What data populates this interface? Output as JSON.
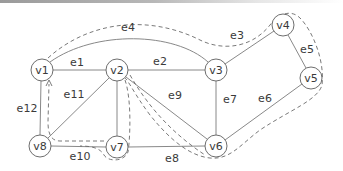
{
  "diagram": {
    "type": "undirected-graph",
    "nodes": [
      {
        "id": "v1",
        "label": "v1",
        "x": 42,
        "y": 70
      },
      {
        "id": "v2",
        "label": "v2",
        "x": 117,
        "y": 70
      },
      {
        "id": "v3",
        "label": "v3",
        "x": 216,
        "y": 70
      },
      {
        "id": "v4",
        "label": "v4",
        "x": 283,
        "y": 25
      },
      {
        "id": "v5",
        "label": "v5",
        "x": 311,
        "y": 78
      },
      {
        "id": "v6",
        "label": "v6",
        "x": 216,
        "y": 146
      },
      {
        "id": "v7",
        "label": "v7",
        "x": 117,
        "y": 147
      },
      {
        "id": "v8",
        "label": "v8",
        "x": 40,
        "y": 146
      }
    ],
    "edges": [
      {
        "id": "e1",
        "label": "e1",
        "from": "v1",
        "to": "v2"
      },
      {
        "id": "e2",
        "label": "e2",
        "from": "v2",
        "to": "v3"
      },
      {
        "id": "e3",
        "label": "e3",
        "from": "v3",
        "to": "v4"
      },
      {
        "id": "e4",
        "label": "e4",
        "from": "v1",
        "to": "v3",
        "curved": true
      },
      {
        "id": "e5",
        "label": "e5",
        "from": "v4",
        "to": "v5"
      },
      {
        "id": "e6",
        "label": "e6",
        "from": "v5",
        "to": "v6"
      },
      {
        "id": "e7",
        "label": "e7",
        "from": "v3",
        "to": "v6"
      },
      {
        "id": "e8",
        "label": "e8",
        "from": "v7",
        "to": "v6"
      },
      {
        "id": "e9",
        "label": "e9",
        "from": "v2",
        "to": "v6"
      },
      {
        "id": "e10",
        "label": "e10",
        "from": "v8",
        "to": "v7"
      },
      {
        "id": "e11",
        "label": "e11",
        "from": "v2",
        "to": "v8"
      },
      {
        "id": "e12",
        "label": "e12",
        "from": "v1",
        "to": "v8"
      }
    ],
    "highlighted_path": {
      "style": "dashed",
      "description": "Dashed closed route traversing around the graph, ending with an arrow pointing up toward v1",
      "arrowhead_near": "v1"
    },
    "labels": {
      "v1": "v1",
      "v2": "v2",
      "v3": "v3",
      "v4": "v4",
      "v5": "v5",
      "v6": "v6",
      "v7": "v7",
      "v8": "v8",
      "e1": "e1",
      "e2": "e2",
      "e3": "e3",
      "e4": "e4",
      "e5": "e5",
      "e6": "e6",
      "e7": "e7",
      "e8": "e8",
      "e9": "e9",
      "e10": "e10",
      "e11": "e11",
      "e12": "e12"
    }
  }
}
